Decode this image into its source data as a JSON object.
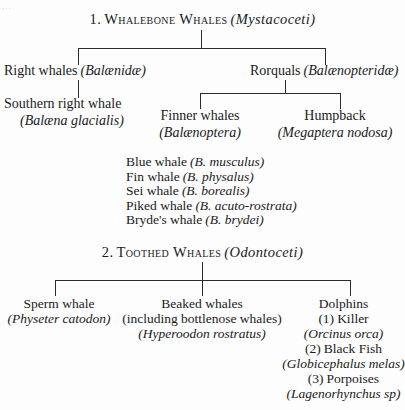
{
  "page": {
    "artifact_top_left": "...",
    "title_note": "Classification tree of whales (Cetacea)"
  },
  "tree1": {
    "root": {
      "number": "1.",
      "name": "Whalebone Whales",
      "sci": "(Mystacoceti)"
    },
    "families": [
      {
        "name": "Right whales",
        "sci": "(Balænidæ)"
      },
      {
        "name": "Rorquals",
        "sci": "(Balænopteridæ)"
      }
    ],
    "right_whale_child": {
      "name": "Southern right whale",
      "sci": "(Balæna glacialis)"
    },
    "rorqual_children": [
      {
        "name": "Finner whales",
        "sci": "(Balænoptera)"
      },
      {
        "name": "Humpback",
        "sci": "(Megaptera nodosa)"
      }
    ],
    "species": [
      {
        "common": "Blue whale",
        "sci": "(B. musculus)"
      },
      {
        "common": "Fin whale",
        "sci": "(B. physalus)"
      },
      {
        "common": "Sei whale",
        "sci": "(B. borealis)"
      },
      {
        "common": "Piked whale",
        "sci": "(B. acuto-rostrata)"
      },
      {
        "common": "Bryde's whale",
        "sci": "(B. brydei)"
      }
    ]
  },
  "tree2": {
    "root": {
      "number": "2.",
      "name": "Toothed Whales",
      "sci": "(Odontoceti)"
    },
    "branches": {
      "sperm": {
        "name": "Sperm whale",
        "sci": "(Physeter catodon)"
      },
      "beaked": {
        "name": "Beaked whales",
        "note": "(including bottlenose whales)",
        "sci": "(Hyperoodon rostratus)"
      },
      "dolphins": {
        "name": "Dolphins",
        "items": [
          {
            "num": "(1)",
            "common": "Killer",
            "sci": "(Orcinus orca)"
          },
          {
            "num": "(2)",
            "common": "Black Fish",
            "sci": "(Globicephalus melas)"
          },
          {
            "num": "(3)",
            "common": "Porpoises",
            "sci": "(Lagenorhynchus sp)"
          }
        ]
      }
    }
  }
}
